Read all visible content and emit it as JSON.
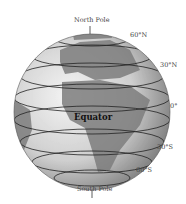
{
  "diagram": {
    "labels": {
      "north_pole": "North Pole",
      "south_pole": "South Pole",
      "equator": "Equator",
      "lat_60n": "60°N",
      "lat_30n": "30°N",
      "lat_0": "0°",
      "lat_30s": "30°S",
      "lat_60s": "60°S"
    },
    "colors": {
      "ocean_light": "#f2f2f2",
      "ocean_shade": "#8c8c8c",
      "land": "#7a7a7a",
      "lines": "#222222"
    }
  }
}
